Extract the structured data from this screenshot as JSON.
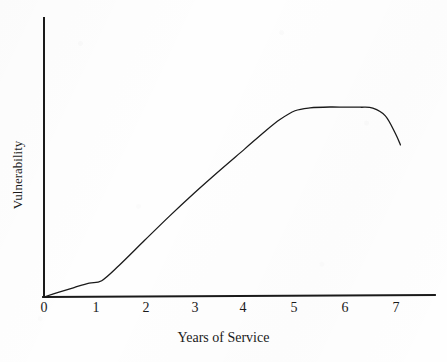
{
  "figure": {
    "background_color": "#fefefe",
    "ink_color": "#1a1a1a",
    "width": 447,
    "height": 362
  },
  "chart_data": {
    "type": "line",
    "title": "",
    "subtitle": "",
    "xlabel": "Years of Service",
    "ylabel": "Vulnerability",
    "xlim": [
      0,
      7.8
    ],
    "ylim": [
      0,
      1.0
    ],
    "grid": false,
    "legend": null,
    "legend_position": "none",
    "x_tick_labels": [
      "0",
      "1",
      "2",
      "3",
      "4",
      "5",
      "6",
      "7"
    ],
    "x_ticks": [
      0,
      1,
      2,
      3,
      4,
      5,
      6,
      7
    ],
    "y_tick_labels": [],
    "y_ticks": [],
    "annotations": [],
    "series": [
      {
        "name": "Vulnerability",
        "line_color": "#1a1a1a",
        "line_width": 1.3,
        "x": [
          0,
          0.3,
          0.6,
          0.9,
          1.15,
          1.5,
          2,
          2.5,
          3,
          3.5,
          4,
          4.4,
          4.7,
          5,
          5.3,
          5.7,
          6,
          6.3,
          6.55,
          6.8,
          7,
          7.1
        ],
        "y": [
          0,
          0.022,
          0.043,
          0.063,
          0.074,
          0.144,
          0.256,
          0.367,
          0.473,
          0.574,
          0.672,
          0.751,
          0.805,
          0.845,
          0.858,
          0.862,
          0.861,
          0.861,
          0.857,
          0.822,
          0.742,
          0.69
        ]
      }
    ]
  },
  "axes": {
    "x_axis_name": "x-axis-line",
    "y_axis_name": "y-axis-line"
  }
}
